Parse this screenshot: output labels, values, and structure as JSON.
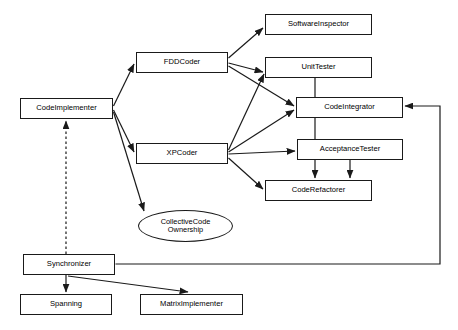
{
  "diagram": {
    "type": "flow-diagram",
    "title": "",
    "background_color": "#ffffff",
    "line_color": "#1a1a1a",
    "text_color": "#000000",
    "nodes": [
      {
        "id": "code-implementer",
        "label": "CodeImplementer",
        "shape": "rectangle",
        "x": 20,
        "y": 98,
        "w": 93,
        "h": 21,
        "font_size": 7.6
      },
      {
        "id": "fdd-coder",
        "label": "FDDCoder",
        "shape": "rectangle",
        "x": 136,
        "y": 52,
        "w": 92,
        "h": 21,
        "font_size": 7.6
      },
      {
        "id": "xp-coder",
        "label": "XPCoder",
        "shape": "rectangle",
        "x": 136,
        "y": 143,
        "w": 92,
        "h": 21,
        "font_size": 7.6
      },
      {
        "id": "software-inspector",
        "label": "SoftwareInspector",
        "shape": "rectangle",
        "x": 265,
        "y": 14,
        "w": 107,
        "h": 21,
        "font_size": 7.6
      },
      {
        "id": "unit-tester",
        "label": "UnitTester",
        "shape": "rectangle",
        "x": 265,
        "y": 57,
        "w": 107,
        "h": 21,
        "font_size": 7.6
      },
      {
        "id": "code-integrator",
        "label": "CodeIntegrator",
        "shape": "rectangle",
        "x": 296,
        "y": 97,
        "w": 107,
        "h": 21,
        "font_size": 7.6
      },
      {
        "id": "acceptance-tester",
        "label": "AcceptanceTester",
        "shape": "rectangle",
        "x": 297,
        "y": 139,
        "w": 106,
        "h": 21,
        "font_size": 7.6
      },
      {
        "id": "code-refactorer",
        "label": "CodeRefactorer",
        "shape": "rectangle",
        "x": 265,
        "y": 180,
        "w": 107,
        "h": 21,
        "font_size": 7.6
      },
      {
        "id": "collective-code-ownership",
        "label": "CollectiveCode\nOwnership",
        "shape": "ellipse",
        "x": 138,
        "y": 210,
        "w": 95,
        "h": 32,
        "font_size": 7.4
      },
      {
        "id": "synchronizer",
        "label": "Synchronizer",
        "shape": "rectangle",
        "x": 23,
        "y": 254,
        "w": 92,
        "h": 21,
        "font_size": 7.6
      },
      {
        "id": "spanning",
        "label": "Spanning",
        "shape": "rectangle",
        "x": 20,
        "y": 294,
        "w": 92,
        "h": 21,
        "font_size": 7.6
      },
      {
        "id": "matrix-implementer",
        "label": "MatrixImplementer",
        "shape": "rectangle",
        "x": 140,
        "y": 294,
        "w": 103,
        "h": 21,
        "font_size": 7.6
      }
    ],
    "edges": [
      {
        "id": "edge-codeimplementer-fddcoder",
        "from": "code-implementer",
        "to": "fdd-coder",
        "style": "solid",
        "arrow": "end"
      },
      {
        "id": "edge-codeimplementer-xpcoder",
        "from": "code-implementer",
        "to": "xp-coder",
        "style": "solid",
        "arrow": "end"
      },
      {
        "id": "edge-codeimplementer-collectivecode",
        "from": "code-implementer",
        "to": "collective-code-ownership",
        "style": "solid",
        "arrow": "end"
      },
      {
        "id": "edge-fddcoder-softwareinspector",
        "from": "fdd-coder",
        "to": "software-inspector",
        "style": "solid",
        "arrow": "end"
      },
      {
        "id": "edge-fddcoder-unittester",
        "from": "fdd-coder",
        "to": "unit-tester",
        "style": "solid",
        "arrow": "end"
      },
      {
        "id": "edge-fddcoder-codeintegrator",
        "from": "fdd-coder",
        "to": "code-integrator",
        "style": "solid",
        "arrow": "end"
      },
      {
        "id": "edge-xpcoder-unittester",
        "from": "xp-coder",
        "to": "unit-tester",
        "style": "solid",
        "arrow": "end"
      },
      {
        "id": "edge-xpcoder-codeintegrator",
        "from": "xp-coder",
        "to": "code-integrator",
        "style": "solid",
        "arrow": "end"
      },
      {
        "id": "edge-xpcoder-acceptancetester",
        "from": "xp-coder",
        "to": "acceptance-tester",
        "style": "solid",
        "arrow": "end"
      },
      {
        "id": "edge-xpcoder-coderefactorer",
        "from": "xp-coder",
        "to": "code-refactorer",
        "style": "solid",
        "arrow": "end"
      },
      {
        "id": "edge-unittester-coderefactorer",
        "from": "unit-tester",
        "to": "code-refactorer",
        "style": "solid",
        "arrow": "end"
      },
      {
        "id": "edge-acceptancetester-coderefactorer",
        "from": "acceptance-tester",
        "to": "code-refactorer",
        "style": "solid",
        "arrow": "end"
      },
      {
        "id": "edge-synchronizer-codeintegrator",
        "from": "synchronizer",
        "to": "code-integrator",
        "style": "solid",
        "arrow": "end"
      },
      {
        "id": "edge-synchronizer-codeimplementer",
        "from": "synchronizer",
        "to": "code-implementer",
        "style": "dashed",
        "arrow": "end"
      },
      {
        "id": "edge-synchronizer-spanning",
        "from": "synchronizer",
        "to": "spanning",
        "style": "solid",
        "arrow": "end"
      },
      {
        "id": "edge-synchronizer-matriximplementer",
        "from": "synchronizer",
        "to": "matrix-implementer",
        "style": "solid",
        "arrow": "end"
      }
    ]
  }
}
